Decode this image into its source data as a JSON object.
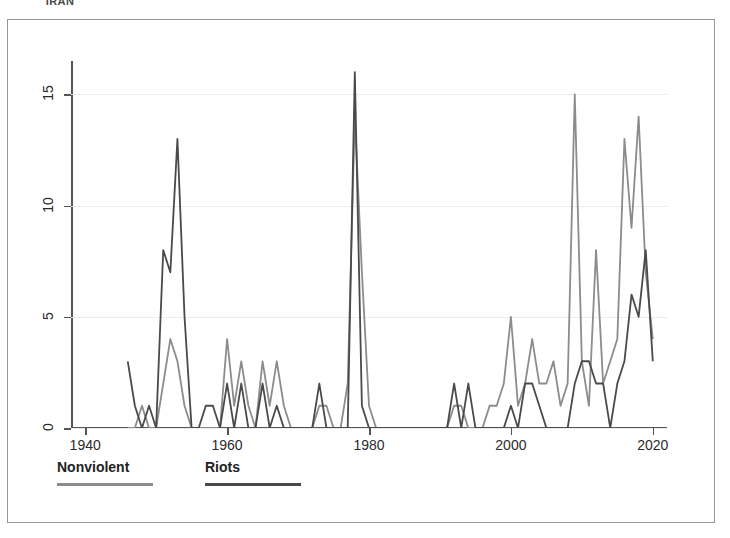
{
  "page_title": "IRAN",
  "legend": {
    "entries": [
      {
        "label": "Nonviolent",
        "color": "#8c8c8c",
        "left": 0,
        "swatch_width": 96
      },
      {
        "label": "Riots",
        "color": "#4a4a4a",
        "left": 148,
        "swatch_width": 96
      }
    ]
  },
  "chart_data": {
    "type": "line",
    "title": "IRAN",
    "xlabel": "",
    "ylabel": "",
    "xlim": [
      1938,
      2022
    ],
    "ylim": [
      0,
      16.5
    ],
    "xticks": [
      1940,
      1960,
      1980,
      2000,
      2020
    ],
    "yticks": [
      0,
      5,
      10,
      15
    ],
    "grid": true,
    "grid_axis": "y",
    "legend_position": "below-plot",
    "series": [
      {
        "name": "Nonviolent",
        "color": "#8c8c8c",
        "x": [
          1946,
          1947,
          1948,
          1949,
          1950,
          1951,
          1952,
          1953,
          1954,
          1955,
          1956,
          1957,
          1958,
          1959,
          1960,
          1961,
          1962,
          1963,
          1964,
          1965,
          1966,
          1967,
          1968,
          1969,
          1970,
          1971,
          1972,
          1973,
          1974,
          1975,
          1976,
          1977,
          1978,
          1979,
          1980,
          1981,
          1982,
          1983,
          1984,
          1985,
          1986,
          1987,
          1988,
          1989,
          1990,
          1991,
          1992,
          1993,
          1994,
          1995,
          1996,
          1997,
          1998,
          1999,
          2000,
          2001,
          2002,
          2003,
          2004,
          2005,
          2006,
          2007,
          2008,
          2009,
          2010,
          2011,
          2012,
          2013,
          2014,
          2015,
          2016,
          2017,
          2018,
          2019,
          2020
        ],
        "values": [
          0,
          0,
          1,
          0,
          0,
          2,
          4,
          3,
          1,
          0,
          0,
          0,
          0,
          0,
          4,
          1,
          3,
          1,
          0,
          3,
          1,
          3,
          1,
          0,
          0,
          0,
          0,
          1,
          1,
          0,
          0,
          2,
          14,
          7,
          1,
          0,
          0,
          0,
          0,
          0,
          0,
          0,
          0,
          0,
          0,
          0,
          1,
          1,
          0,
          0,
          0,
          1,
          1,
          2,
          5,
          1,
          2,
          4,
          2,
          2,
          3,
          1,
          2,
          15,
          3,
          1,
          8,
          2,
          3,
          4,
          13,
          9,
          14,
          7,
          4
        ]
      },
      {
        "name": "Riots",
        "color": "#4a4a4a",
        "x": [
          1946,
          1947,
          1948,
          1949,
          1950,
          1951,
          1952,
          1953,
          1954,
          1955,
          1956,
          1957,
          1958,
          1959,
          1960,
          1961,
          1962,
          1963,
          1964,
          1965,
          1966,
          1967,
          1968,
          1969,
          1970,
          1971,
          1972,
          1973,
          1974,
          1975,
          1976,
          1977,
          1978,
          1979,
          1980,
          1981,
          1982,
          1983,
          1984,
          1985,
          1986,
          1987,
          1988,
          1989,
          1990,
          1991,
          1992,
          1993,
          1994,
          1995,
          1996,
          1997,
          1998,
          1999,
          2000,
          2001,
          2002,
          2003,
          2004,
          2005,
          2006,
          2007,
          2008,
          2009,
          2010,
          2011,
          2012,
          2013,
          2014,
          2015,
          2016,
          2017,
          2018,
          2019,
          2020
        ],
        "values": [
          3,
          1,
          0,
          1,
          0,
          8,
          7,
          13,
          5,
          0,
          0,
          1,
          1,
          0,
          2,
          0,
          2,
          0,
          0,
          2,
          0,
          1,
          0,
          0,
          0,
          0,
          0,
          2,
          0,
          0,
          0,
          0,
          16,
          1,
          0,
          0,
          0,
          0,
          0,
          0,
          0,
          0,
          0,
          0,
          0,
          0,
          2,
          0,
          2,
          0,
          0,
          0,
          0,
          0,
          1,
          0,
          2,
          2,
          1,
          0,
          0,
          0,
          0,
          2,
          3,
          3,
          2,
          2,
          0,
          2,
          3,
          6,
          5,
          8,
          3
        ]
      }
    ]
  }
}
